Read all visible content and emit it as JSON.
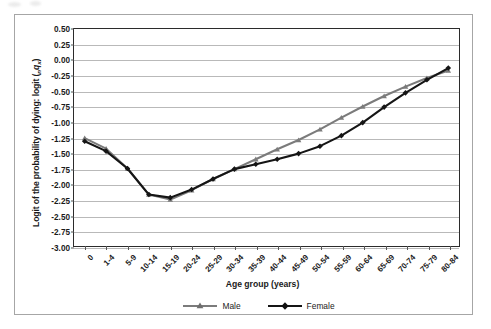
{
  "chart_data": {
    "type": "line",
    "title": "",
    "xlabel": "Age group (years)",
    "ylabel": "Logit of the probability of dying: logit (nqx)",
    "ylabel_parts": {
      "main": "Logit of the probability of dying: logit (",
      "sub_n": "n",
      "var_q": "q",
      "sub_x": "x",
      "close": ")"
    },
    "categories": [
      "0",
      "1-4",
      "5-9",
      "10-14",
      "15-19",
      "20-24",
      "25-29",
      "30-34",
      "35-39",
      "40-44",
      "45-49",
      "50-54",
      "55-59",
      "60-64",
      "65-69",
      "70-74",
      "75-79",
      "80-84"
    ],
    "yticks": [
      "0.50",
      "0.25",
      "0.00",
      "-0.25",
      "-0.50",
      "-0.75",
      "-1.00",
      "-1.25",
      "-1.50",
      "-1.75",
      "-2.00",
      "-2.25",
      "-2.50",
      "-2.75",
      "-3.00"
    ],
    "ytick_values": [
      0.5,
      0.25,
      0.0,
      -0.25,
      -0.5,
      -0.75,
      -1.0,
      -1.25,
      -1.5,
      -1.75,
      -2.0,
      -2.25,
      -2.5,
      -2.75,
      -3.0
    ],
    "ylim": [
      -3.0,
      0.5
    ],
    "grid": "horizontal",
    "legend_position": "bottom-center",
    "series": [
      {
        "name": "Male",
        "color": "#7b7b7b",
        "marker": "triangle",
        "values": [
          -1.26,
          -1.43,
          -1.75,
          -2.17,
          -2.25,
          -2.1,
          -1.92,
          -1.76,
          -1.6,
          -1.44,
          -1.29,
          -1.12,
          -0.93,
          -0.75,
          -0.58,
          -0.43,
          -0.29,
          -0.17
        ]
      },
      {
        "name": "Female",
        "color": "#151515",
        "marker": "diamond",
        "values": [
          -1.31,
          -1.47,
          -1.75,
          -2.17,
          -2.22,
          -2.09,
          -1.92,
          -1.76,
          -1.68,
          -1.6,
          -1.51,
          -1.39,
          -1.22,
          -1.01,
          -0.76,
          -0.53,
          -0.32,
          -0.13
        ]
      }
    ]
  },
  "legend": {
    "entries": [
      {
        "label": "Male"
      },
      {
        "label": "Female"
      }
    ]
  }
}
